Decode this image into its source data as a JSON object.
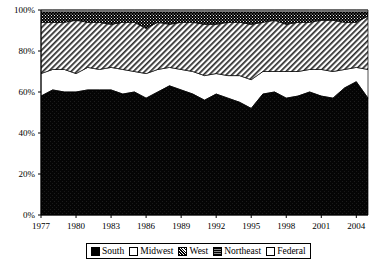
{
  "chart_data": {
    "type": "area",
    "stacked": true,
    "normalized": "100%",
    "title": "",
    "subtitle": "",
    "xlabel": "",
    "ylabel": "",
    "xlim": [
      1977,
      2005
    ],
    "ylim": [
      0,
      100
    ],
    "grid": false,
    "legend_position": "bottom",
    "y_ticks": [
      "0%",
      "20%",
      "40%",
      "60%",
      "80%",
      "100%"
    ],
    "y_tick_values": [
      0,
      20,
      40,
      60,
      80,
      100
    ],
    "x_ticks": [
      "1977",
      "1980",
      "1983",
      "1986",
      "1989",
      "1992",
      "1995",
      "1998",
      "2001",
      "2004"
    ],
    "x_tick_values": [
      1977,
      1980,
      1983,
      1986,
      1989,
      1992,
      1995,
      1998,
      2001,
      2004
    ],
    "x": [
      1977,
      1978,
      1979,
      1980,
      1981,
      1982,
      1983,
      1984,
      1985,
      1986,
      1987,
      1988,
      1989,
      1990,
      1991,
      1992,
      1993,
      1994,
      1995,
      1996,
      1997,
      1998,
      1999,
      2000,
      2001,
      2002,
      2003,
      2004,
      2005
    ],
    "series": [
      {
        "name": "South",
        "fill": "solid-black",
        "color": "#000000",
        "values": [
          58,
          61,
          60,
          60,
          61,
          61,
          61,
          59,
          60,
          57,
          60,
          63,
          61,
          59,
          56,
          59,
          57,
          55,
          52,
          59,
          60,
          57,
          58,
          60,
          58,
          57,
          62,
          65,
          57
        ]
      },
      {
        "name": "Midwest",
        "fill": "white",
        "color": "#ffffff",
        "values": [
          11,
          10,
          11,
          9,
          11,
          10,
          11,
          12,
          10,
          12,
          11,
          9,
          10,
          11,
          12,
          10,
          11,
          13,
          14,
          11,
          10,
          13,
          12,
          11,
          13,
          13,
          9,
          7,
          14
        ]
      },
      {
        "name": "West",
        "fill": "diagonal-hatch",
        "color": "#b8b8b8",
        "values": [
          25,
          23,
          23,
          26,
          22,
          23,
          21,
          23,
          24,
          22,
          23,
          21,
          23,
          24,
          25,
          24,
          26,
          26,
          27,
          24,
          25,
          23,
          24,
          23,
          24,
          25,
          23,
          22,
          26
        ]
      },
      {
        "name": "Northeast",
        "fill": "dark-speckle",
        "color": "#1a1a1a",
        "values": [
          5,
          5,
          5,
          4,
          5,
          5,
          6,
          5,
          5,
          8,
          5,
          6,
          5,
          5,
          6,
          6,
          5,
          5,
          6,
          5,
          4,
          6,
          5,
          5,
          4,
          4,
          5,
          5,
          2
        ]
      },
      {
        "name": "Federal",
        "fill": "white",
        "color": "#ffffff",
        "values": [
          1,
          1,
          1,
          1,
          1,
          1,
          1,
          1,
          1,
          1,
          1,
          1,
          1,
          1,
          1,
          1,
          1,
          1,
          1,
          1,
          1,
          1,
          1,
          1,
          1,
          1,
          1,
          1,
          1
        ]
      }
    ],
    "legend": [
      {
        "label": "South",
        "swatch": "solid-black"
      },
      {
        "label": "Midwest",
        "swatch": "white"
      },
      {
        "label": "West",
        "swatch": "checker"
      },
      {
        "label": "Northeast",
        "swatch": "dark-speckle"
      },
      {
        "label": "Federal",
        "swatch": "white"
      }
    ]
  }
}
